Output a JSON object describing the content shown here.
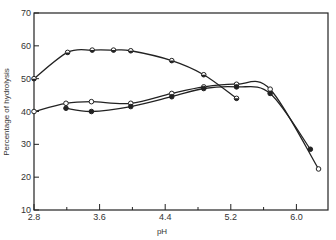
{
  "chart_data": {
    "type": "line",
    "title": "",
    "xlabel": "pH",
    "ylabel": "Percentage of hydrolysis",
    "xlim": [
      2.8,
      6.4
    ],
    "ylim": [
      10,
      70
    ],
    "x_ticks": [
      "2.8",
      "3.6",
      "4.4",
      "5.2",
      "6.0"
    ],
    "x_minor_ticks": [
      3.2,
      4.0,
      4.8,
      5.6
    ],
    "y_ticks": [
      "10",
      "20",
      "30",
      "40",
      "50",
      "60",
      "70"
    ],
    "grid": false,
    "legend": null,
    "series": [
      {
        "name": "half-filled markers",
        "marker": "half-filled-circle",
        "x": [
          2.8,
          3.21,
          3.51,
          3.77,
          3.98,
          4.48,
          4.87,
          5.27
        ],
        "values": [
          50,
          58,
          58.7,
          58.7,
          58.5,
          55.5,
          51.2,
          44
        ]
      },
      {
        "name": "open markers",
        "marker": "open-circle",
        "x": [
          2.8,
          3.19,
          3.5,
          3.98,
          4.48,
          4.87,
          5.27,
          5.68,
          6.27
        ],
        "values": [
          40,
          42.5,
          43,
          42.5,
          45.5,
          47.5,
          48.3,
          46.8,
          22.5
        ]
      },
      {
        "name": "filled markers",
        "marker": "filled-circle",
        "x": [
          3.19,
          3.5,
          3.98,
          4.48,
          4.87,
          5.27,
          5.68,
          6.17
        ],
        "values": [
          41,
          40,
          41.5,
          44.5,
          47,
          47.5,
          45.5,
          28.5
        ]
      }
    ]
  }
}
